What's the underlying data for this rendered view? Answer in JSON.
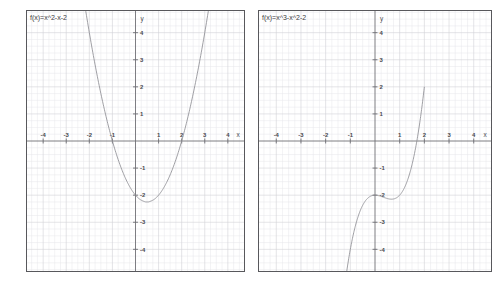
{
  "page": {
    "background_color": "#ffffff",
    "width": 501,
    "height": 294,
    "panel_count": 2
  },
  "style": {
    "curve_color": "#8d8d93",
    "axis_color": "#6e6e74",
    "minor_grid_color": "#e7e7ea",
    "major_grid_color": "#d2d2d6",
    "border_color": "#58585c",
    "label_color": "#3c3c41"
  },
  "panels": [
    {
      "id": "left",
      "label": "f(x)=x^2-x-2",
      "x_axis_name": "x",
      "y_axis_name": "y"
    },
    {
      "id": "right",
      "label": "f(x)=x^3-x^2-2",
      "x_axis_name": "x",
      "y_axis_name": "y"
    }
  ],
  "chart_data": [
    {
      "type": "line",
      "title": "f(x)=x^2-x-2",
      "xlabel": "x",
      "ylabel": "y",
      "xlim": [
        -4.7,
        4.7
      ],
      "ylim": [
        -4.8,
        4.8
      ],
      "xticks": [
        -4,
        -3,
        -2,
        -1,
        1,
        2,
        3,
        4
      ],
      "yticks": [
        -4,
        -3,
        -2,
        -1,
        1,
        2,
        3,
        4
      ],
      "xtick_labels": [
        "-4",
        "-3",
        "-2",
        "-1",
        "1",
        "2",
        "3",
        "4"
      ],
      "ytick_labels": [
        "-4",
        "-3",
        "-2",
        "-1",
        "1",
        "2",
        "3",
        "4"
      ],
      "grid": true,
      "minor_grid_step": 0.25,
      "major_grid_step": 1,
      "legend": "none",
      "expression": "x^2 - x - 2",
      "roots": [
        -1,
        2
      ],
      "vertex": [
        0.5,
        -2.25
      ],
      "y_intercept": -2,
      "series": [
        {
          "name": "f(x)=x^2-x-2",
          "x": [
            -2.6,
            -2.4,
            -2.2,
            -2.0,
            -1.8,
            -1.6,
            -1.4,
            -1.2,
            -1.0,
            -0.8,
            -0.6,
            -0.4,
            -0.2,
            0.0,
            0.2,
            0.4,
            0.5,
            0.6,
            0.8,
            1.0,
            1.2,
            1.4,
            1.6,
            1.8,
            2.0,
            2.2,
            2.4,
            2.6,
            2.8,
            3.0,
            3.2,
            3.4,
            3.6
          ],
          "values": [
            7.36,
            6.16,
            5.04,
            4.0,
            3.04,
            2.16,
            1.36,
            0.64,
            0.0,
            -0.56,
            -1.04,
            -1.44,
            -1.76,
            -2.0,
            -2.16,
            -2.24,
            -2.25,
            -2.24,
            -2.16,
            -2.0,
            -1.76,
            -1.44,
            -1.04,
            -0.56,
            0.0,
            0.64,
            1.36,
            2.16,
            3.04,
            4.0,
            5.04,
            6.16,
            7.36
          ]
        }
      ]
    },
    {
      "type": "line",
      "title": "f(x)=x^3-x^2-2",
      "xlabel": "x",
      "ylabel": "y",
      "xlim": [
        -4.7,
        4.7
      ],
      "ylim": [
        -4.8,
        4.8
      ],
      "xticks": [
        -4,
        -3,
        -2,
        -1,
        1,
        2,
        3,
        4
      ],
      "yticks": [
        -4,
        -3,
        -2,
        -1,
        1,
        2,
        3,
        4
      ],
      "xtick_labels": [
        "-4",
        "-3",
        "-2",
        "-1",
        "1",
        "2",
        "3",
        "4"
      ],
      "ytick_labels": [
        "-4",
        "-3",
        "-2",
        "-1",
        "1",
        "2",
        "3",
        "4"
      ],
      "grid": true,
      "minor_grid_step": 0.25,
      "major_grid_step": 1,
      "legend": "none",
      "expression": "x^3 - x^2 - 2",
      "roots": [
        1.6956
      ],
      "local_max": [
        0,
        -2
      ],
      "local_min": [
        0.6667,
        -2.1481
      ],
      "y_intercept": -2,
      "series": [
        {
          "name": "f(x)=x^3-x^2-2",
          "x": [
            -1.3,
            -1.2,
            -1.1,
            -1.0,
            -0.9,
            -0.8,
            -0.7,
            -0.6,
            -0.5,
            -0.4,
            -0.3,
            -0.2,
            -0.1,
            0.0,
            0.1,
            0.2,
            0.3,
            0.4,
            0.5,
            0.6,
            0.7,
            0.8,
            0.9,
            1.0,
            1.1,
            1.2,
            1.3,
            1.4,
            1.5,
            1.6,
            1.7,
            1.8,
            1.9,
            2.0
          ],
          "values": [
            -5.887,
            -5.168,
            -4.541,
            -4.0,
            -3.539,
            -3.152,
            -2.833,
            -2.576,
            -2.375,
            -2.224,
            -2.117,
            -2.048,
            -2.011,
            -2.0,
            -2.009,
            -2.032,
            -2.063,
            -2.096,
            -2.125,
            -2.144,
            -2.147,
            -2.128,
            -2.081,
            -2.0,
            -1.879,
            -1.712,
            -1.493,
            -1.216,
            -0.875,
            -0.464,
            0.023,
            0.592,
            1.249,
            2.0
          ]
        }
      ]
    }
  ]
}
